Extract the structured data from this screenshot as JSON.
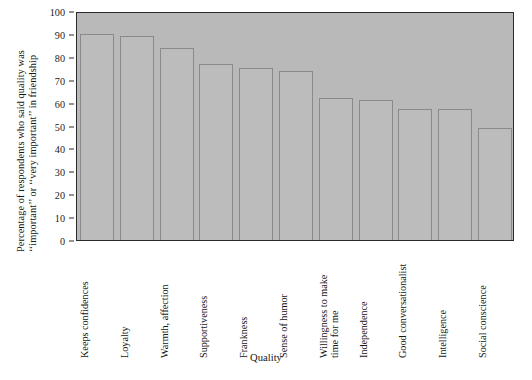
{
  "chart_data": {
    "type": "bar",
    "title": "",
    "xlabel": "Quality",
    "ylabel_line1": "Percentage of respondents who said quality was",
    "ylabel_line2": "‘‘important’’ or ‘‘very important’’ in friendship",
    "categories": [
      "Keeps confidences",
      "Loyalty",
      "Warmth, affection",
      "Supportiveness",
      "Frankness",
      "Sense of humor",
      "Willingness to make|time for me",
      "Independence",
      "Good conversationalist",
      "Intelligence",
      "Social conscience"
    ],
    "values": [
      90,
      89,
      84,
      77,
      75,
      74,
      62,
      61,
      57,
      57,
      49
    ],
    "ylim": [
      0,
      100
    ],
    "yticks": [
      0,
      10,
      20,
      30,
      40,
      50,
      60,
      70,
      80,
      90,
      100
    ],
    "ytick_labels": [
      "0",
      "10",
      "20",
      "30",
      "40",
      "50",
      "60",
      "70",
      "80",
      "90",
      "100"
    ],
    "grid": false,
    "legend": null,
    "bar_fill_color": "#bcbcbc",
    "bar_edge_color": "#8a8a8a",
    "plot_background_color": "#b9b9b9",
    "axis_color": "#2b2b2b"
  }
}
